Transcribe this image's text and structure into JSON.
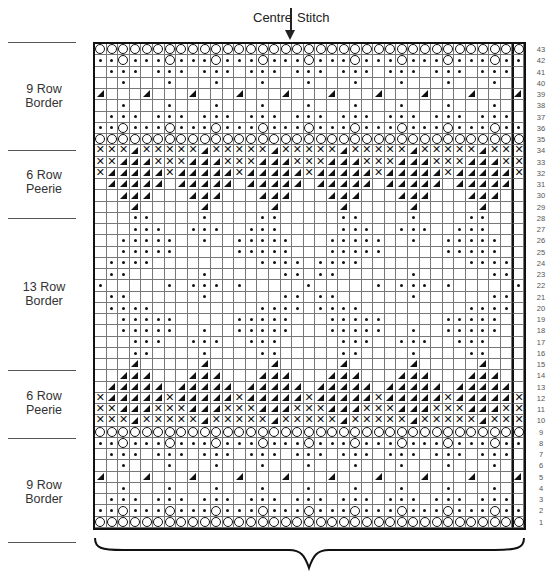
{
  "header": {
    "centre_left": "Centre",
    "centre_right": "Stitch",
    "arrow_icon": "down-arrow"
  },
  "sections": [
    {
      "label_line1": "9 Row",
      "label_line2": "Border",
      "rows": "35-43"
    },
    {
      "label_line1": "6 Row",
      "label_line2": "Peerie",
      "rows": "29-34"
    },
    {
      "label_line1": "13 Row",
      "label_line2": "Border",
      "rows": "16-28"
    },
    {
      "label_line1": "6 Row",
      "label_line2": "Peerie",
      "rows": "10-15"
    },
    {
      "label_line1": "9 Row",
      "label_line2": "Border",
      "rows": "1-9"
    }
  ],
  "chart": {
    "columns": 37,
    "rows": 43,
    "legend_symbols": {
      "O": "circle",
      "D": "dot",
      "T": "triangle",
      "X": "cross",
      "_": "blank"
    },
    "grid_rows_top_to_bottom": [
      {
        "n": "43",
        "cells": "OOOOOOOOOOOOOOOOOOOOOOOOOOOOOOOOOOOOO"
      },
      {
        "n": "42",
        "cells": "DDODDDODDDODDDODDDODDDODDDODDDODDDODD"
      },
      {
        "n": "41",
        "cells": "_DDD_DDD_DDD_DDD_DDD_DDD_DDD_DDD_DDD_"
      },
      {
        "n": "40",
        "cells": "__D___D___D___D___D___D___D___D___D__"
      },
      {
        "n": "39",
        "cells": "T___T___T___T___T___T___T___T___T___T"
      },
      {
        "n": "38",
        "cells": "__D___D___D___D___D___D___D___D___D__"
      },
      {
        "n": "37",
        "cells": "_DDD_DDD_DDD_DDD_DDD_DDD_DDD_DDD_DDD_"
      },
      {
        "n": "36",
        "cells": "DDODDDODDDODDDODDDODDDODDDODDDODDDODD"
      },
      {
        "n": "35",
        "cells": "OOOOOOOOOOOOOOOOOOOOOOOOOOOOOOOOOOOOO"
      },
      {
        "n": "34",
        "cells": "XXXTXXXXXTXXXXXTXXXXXTXXXXXTXXXXXTXXX"
      },
      {
        "n": "33",
        "cells": "XXTTTXXXTTTXXXTTTXXXTTTXXXTTTXXXTTTXX"
      },
      {
        "n": "32",
        "cells": "XTTTTTXTTTTTXTTTTTXTTTTTXTTTTTXTTTTTX"
      },
      {
        "n": "31",
        "cells": "_TTTTT_TTTTT_TTTTT_TTTTT_TTTTT_TTTTT_"
      },
      {
        "n": "30",
        "cells": "__TTT___TTT___TTT___TTT___TTT___TTT__"
      },
      {
        "n": "29",
        "cells": "___T_____T_____T_____T_____T_____T___"
      },
      {
        "n": "28",
        "cells": "___DD____D____DD_____DD____D____DD___"
      },
      {
        "n": "27",
        "cells": "___DDD__DDD__DDD_____DDD__DDD__DDD___"
      },
      {
        "n": "26",
        "cells": "__DDDDD__D__DDDDD___DDDDD__D__DDDDD__"
      },
      {
        "n": "25",
        "cells": "__DDDDD_____DDDDD___DDDDD_____DDDDD__"
      },
      {
        "n": "24",
        "cells": "_DDDD_________DDDD_DDDD_________DDDD_"
      },
      {
        "n": "23",
        "cells": "_DD______D______DD_DD______D______DD_"
      },
      {
        "n": "22",
        "cells": "D_____D_DDD_D_____D_____D_DDD_D_____D"
      },
      {
        "n": "21",
        "cells": "_DD______D______DD_DD______D______DD_"
      },
      {
        "n": "20",
        "cells": "_DDDD_________DDDD_DDDD_________DDDD_"
      },
      {
        "n": "19",
        "cells": "__DDDDD_____DDDDD___DDDDD_____DDDDD__"
      },
      {
        "n": "18",
        "cells": "__DDDDD__D__DDDDD___DDDDD__D__DDDDD__"
      },
      {
        "n": "17",
        "cells": "___DDD__DDD__DDD_____DDD__DDD__DDD___"
      },
      {
        "n": "16",
        "cells": "___DD____D____DD_____DD____D____DD___"
      },
      {
        "n": "15",
        "cells": "___T_____T_____T_____T_____T_____T___"
      },
      {
        "n": "14",
        "cells": "__TTT___TTT___TTT___TTT___TTT___TTT__"
      },
      {
        "n": "13",
        "cells": "_TTTTT_TTTTT_TTTTT_TTTTT_TTTTT_TTTTT_"
      },
      {
        "n": "12",
        "cells": "XTTTTTXTTTTTXTTTTTXTTTTTXTTTTTXTTTTTX"
      },
      {
        "n": "11",
        "cells": "XXTTTXXXTTTXXXTTTXXXTTTXXXTTTXXXTTTXX"
      },
      {
        "n": "10",
        "cells": "XXXTXXXXXTXXXXXTXXXXXTXXXXXTXXXXXTXXX"
      },
      {
        "n": "9",
        "cells": "OOOOOOOOOOOOOOOOOOOOOOOOOOOOOOOOOOOOO"
      },
      {
        "n": "8",
        "cells": "DDODDDODDDODDDODDDODDDODDDODDDODDDODD"
      },
      {
        "n": "7",
        "cells": "_DDD_DDD_DDD_DDD_DDD_DDD_DDD_DDD_DDD_"
      },
      {
        "n": "6",
        "cells": "__D___D___D___D___D___D___D___D___D__"
      },
      {
        "n": "5",
        "cells": "T___T___T___T___T___T___T___T___T___T"
      },
      {
        "n": "4",
        "cells": "__D___D___D___D___D___D___D___D___D__"
      },
      {
        "n": "3",
        "cells": "_DDD_DDD_DDD_DDD_DDD_DDD_DDD_DDD_DDD_"
      },
      {
        "n": "2",
        "cells": "DDODDDODDDODDDODDDODDDODDDODDDODDDODD"
      },
      {
        "n": "1",
        "cells": "OOOOOOOOOOOOOOOOOOOOOOOOOOOOOOOOOOOOO"
      }
    ]
  }
}
